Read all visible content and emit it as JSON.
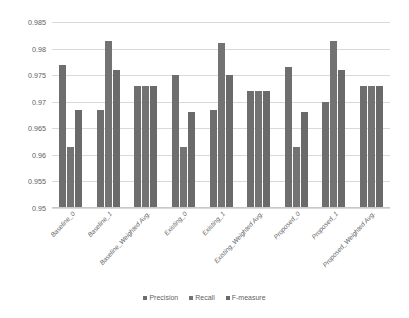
{
  "chart_data": {
    "type": "bar",
    "title": "",
    "xlabel": "",
    "ylabel": "",
    "ylim": [
      0.95,
      0.985
    ],
    "yticks": [
      "0.95",
      "0.955",
      "0.96",
      "0.965",
      "0.97",
      "0.975",
      "0.98",
      "0.985"
    ],
    "ytick_values": [
      0.95,
      0.955,
      0.96,
      0.965,
      0.97,
      0.975,
      0.98,
      0.985
    ],
    "grid": true,
    "legend_position": "bottom",
    "stray_mark": ")",
    "categories": [
      "Baseline_0",
      "Baseline_1",
      "Baseline_Weighted Avg.",
      "Existing_0",
      "Existing_1",
      "Existing_Weighted Avg.",
      "Proposed_0",
      "Proposed_1",
      "Proposed_Weighted Avg."
    ],
    "series": [
      {
        "name": "Precision",
        "color": "#6e6e6e",
        "values": [
          0.977,
          0.9685,
          0.973,
          0.975,
          0.9685,
          0.972,
          0.9765,
          0.97,
          0.973
        ]
      },
      {
        "name": "Recall",
        "color": "#737373",
        "values": [
          0.9615,
          0.9815,
          0.973,
          0.9615,
          0.981,
          0.972,
          0.9615,
          0.9815,
          0.973
        ]
      },
      {
        "name": "F-measure",
        "color": "#6a6a6a",
        "values": [
          0.9685,
          0.976,
          0.973,
          0.968,
          0.975,
          0.972,
          0.968,
          0.976,
          0.973
        ]
      }
    ]
  }
}
